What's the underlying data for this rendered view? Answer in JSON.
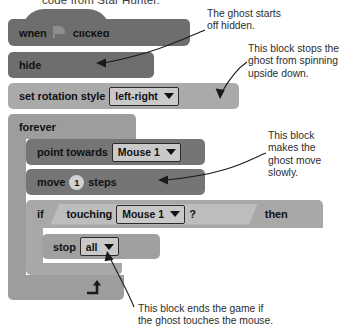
{
  "caption": {
    "text": "code from Star Hunter."
  },
  "script": {
    "blocks": [
      {
        "id": "when-flag-clicked",
        "word1": "when",
        "icon": "green-flag-icon",
        "word2": "clicked"
      },
      {
        "id": "hide",
        "label": "hide"
      },
      {
        "id": "set-rotation-style",
        "label": "set rotation style",
        "dropdown": "left-right"
      },
      {
        "id": "forever",
        "label": "forever",
        "loop_icon": "loop-arrow-icon"
      },
      {
        "id": "point-towards",
        "label": "point towards",
        "dropdown": "Mouse 1"
      },
      {
        "id": "move-steps",
        "word1": "move",
        "value": "1",
        "word2": "steps"
      },
      {
        "id": "if-then",
        "word1": "if",
        "word2": "then",
        "condition": {
          "label": "touching",
          "dropdown": "Mouse 1",
          "question": "?"
        }
      },
      {
        "id": "stop",
        "label": "stop",
        "dropdown": "all"
      }
    ]
  },
  "annotations": [
    {
      "id": "annotation-hide",
      "text": "The ghost starts\noff hidden."
    },
    {
      "id": "annotation-rotation",
      "text": "This block stops the\nghost from spinning\nupside down."
    },
    {
      "id": "annotation-move",
      "text": "This block\nmakes the\nghost move\nslowly."
    },
    {
      "id": "annotation-stop",
      "text": "This block ends the game if\nthe ghost touches the mouse."
    }
  ],
  "colors": {
    "hat_block": "#6e6e6e",
    "motion_block": "#757575",
    "looks_block": "#aaaaaa",
    "control_block": "#9d9d9d",
    "boolean_reporter": "#bdbdbd",
    "dropdown_field": "#c9c9c9",
    "text": "#111111",
    "annotation_text": "#2d2d2d"
  }
}
